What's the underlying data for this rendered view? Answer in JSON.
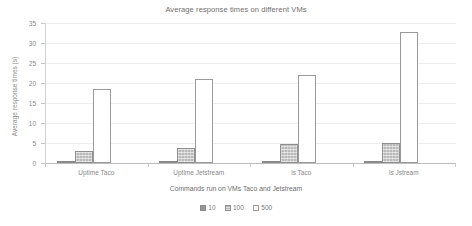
{
  "chart_data": {
    "type": "bar",
    "title": "Average response times on different VMs",
    "xlabel": "Commands run on VMs  Taco and Jetstream",
    "ylabel": "Average response times (s)",
    "categories": [
      "Uptime Taco",
      "Uptime Jetstream",
      "ls Taco",
      "ls Jstream"
    ],
    "series": [
      {
        "name": "10",
        "values": [
          0.4,
          0.2,
          0.4,
          0.2
        ],
        "color": "#969696",
        "style": "solid"
      },
      {
        "name": "100",
        "values": [
          3.1,
          3.7,
          4.7,
          5.0
        ],
        "color": "#b9b9b9",
        "style": "patterned"
      },
      {
        "name": "500",
        "values": [
          18.4,
          21.0,
          22.0,
          32.8
        ],
        "color": "#ffffff",
        "style": "outline"
      }
    ],
    "ylim": [
      0,
      35
    ],
    "yticks": [
      0,
      5,
      10,
      15,
      20,
      25,
      30,
      35
    ],
    "ytick_labels": [
      "0",
      "5",
      "10",
      "15",
      "20",
      "25",
      "30",
      "35"
    ],
    "grid": true,
    "legend_position": "bottom-center"
  }
}
